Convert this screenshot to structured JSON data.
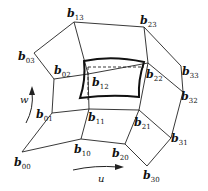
{
  "diagram": {
    "control_points": [
      {
        "id": "b00",
        "base": "b",
        "sub": "00",
        "row": 0,
        "col": 0
      },
      {
        "id": "b10",
        "base": "b",
        "sub": "10",
        "row": 0,
        "col": 1
      },
      {
        "id": "b20",
        "base": "b",
        "sub": "20",
        "row": 0,
        "col": 2
      },
      {
        "id": "b30",
        "base": "b",
        "sub": "30",
        "row": 0,
        "col": 3
      },
      {
        "id": "b01",
        "base": "b",
        "sub": "01",
        "row": 1,
        "col": 0
      },
      {
        "id": "b11",
        "base": "b",
        "sub": "11",
        "row": 1,
        "col": 1
      },
      {
        "id": "b21",
        "base": "b",
        "sub": "21",
        "row": 1,
        "col": 2
      },
      {
        "id": "b31",
        "base": "b",
        "sub": "31",
        "row": 1,
        "col": 3
      },
      {
        "id": "b02",
        "base": "b",
        "sub": "02",
        "row": 2,
        "col": 0
      },
      {
        "id": "b12",
        "base": "b",
        "sub": "12",
        "row": 2,
        "col": 1
      },
      {
        "id": "b22",
        "base": "b",
        "sub": "22",
        "row": 2,
        "col": 2
      },
      {
        "id": "b32",
        "base": "b",
        "sub": "32",
        "row": 2,
        "col": 3
      },
      {
        "id": "b03",
        "base": "b",
        "sub": "03",
        "row": 3,
        "col": 0
      },
      {
        "id": "b13",
        "base": "b",
        "sub": "13",
        "row": 3,
        "col": 1
      },
      {
        "id": "b23",
        "base": "b",
        "sub": "23",
        "row": 3,
        "col": 2
      },
      {
        "id": "b33",
        "base": "b",
        "sub": "33",
        "row": 3,
        "col": 3
      }
    ],
    "params": {
      "u": "u",
      "w": "w"
    }
  }
}
